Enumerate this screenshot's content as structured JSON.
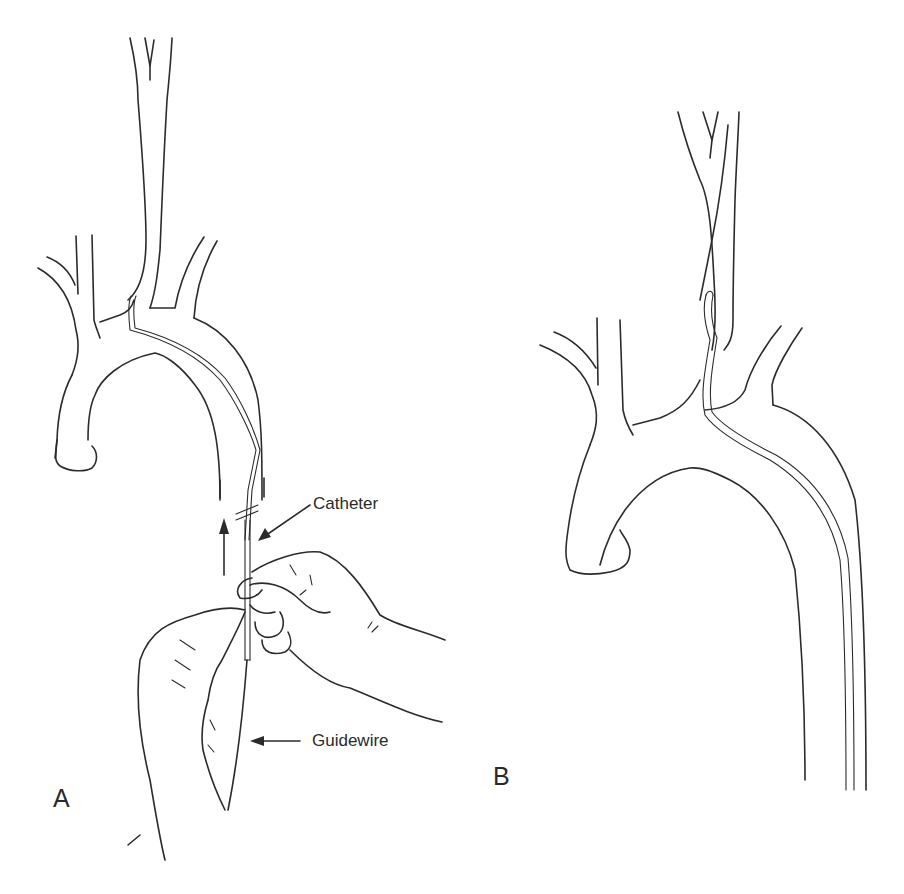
{
  "figure": {
    "type": "medical line illustration",
    "panels": [
      {
        "id": "A",
        "label": "A",
        "callouts": [
          {
            "text": "Catheter",
            "arrow": "points to catheter shaft"
          },
          {
            "text": "Guidewire",
            "arrow": "points to guidewire"
          }
        ],
        "motion_arrow": "upward"
      },
      {
        "id": "B",
        "label": "B",
        "callouts": []
      }
    ],
    "colors": {
      "line": "#2b2b2b",
      "background": "#ffffff",
      "text": "#2a2a2a"
    }
  }
}
